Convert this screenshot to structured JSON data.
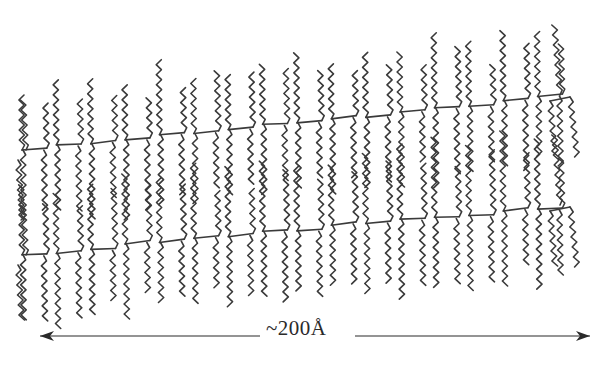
{
  "diagram": {
    "type": "lipid-bilayer-schematic",
    "ink_color": "#3a3a3a",
    "background": "#ffffff",
    "rows": [
      {
        "name": "upper-layer",
        "start": {
          "x": 10,
          "y": 150
        },
        "end": {
          "x": 560,
          "y": 95
        },
        "units": 16,
        "chain_up_length": 60,
        "chain_down_length": 70
      },
      {
        "name": "lower-layer",
        "start": {
          "x": 10,
          "y": 255
        },
        "end": {
          "x": 560,
          "y": 205
        },
        "units": 16,
        "chain_up_length": 65,
        "chain_down_length": 70
      }
    ],
    "scale_bar": {
      "label": "~200Å",
      "x_start": 40,
      "x_end": 590,
      "y": 336,
      "gap_start": 260,
      "gap_end": 355
    }
  }
}
